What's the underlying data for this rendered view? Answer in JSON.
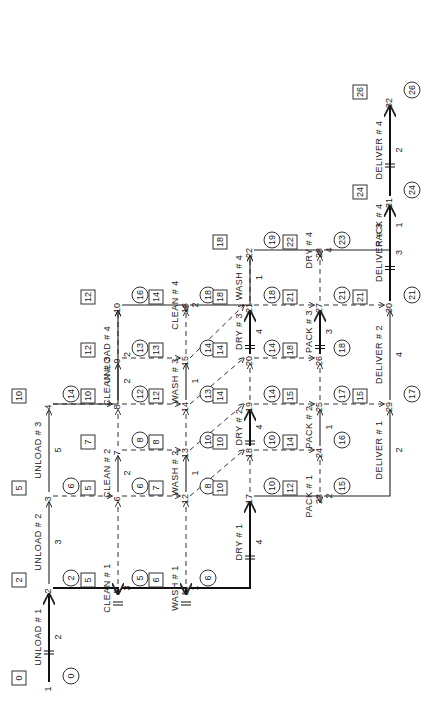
{
  "diagram": {
    "type": "activity-on-arrow network (critical path)",
    "orientation": "rotated 90° counter-clockwise",
    "nodes": [
      {
        "id": 1,
        "early_start": 0,
        "late": 0
      },
      {
        "id": 2,
        "early_start": 2,
        "late": 2
      },
      {
        "id": 3,
        "early_start": 5,
        "late": 6
      },
      {
        "id": 4,
        "early_start": 10,
        "late": 14
      },
      {
        "id": 5,
        "early_start": 5,
        "late": 5
      },
      {
        "id": 6,
        "early_start": 5,
        "late": 6
      },
      {
        "id": 7,
        "early_start": 7,
        "late": 8
      },
      {
        "id": 8,
        "early_start": 10,
        "late": 12
      },
      {
        "id": 9,
        "early_start": 12,
        "late": 13
      },
      {
        "id": 10,
        "early_start": 12,
        "late": 16
      },
      {
        "id": 11,
        "early_start": 6,
        "late": 6
      },
      {
        "id": 12,
        "early_start": 7,
        "late": 8
      },
      {
        "id": 13,
        "early_start": 8,
        "late": 10
      },
      {
        "id": 14,
        "early_start": 12,
        "late": 13
      },
      {
        "id": 15,
        "early_start": 13,
        "late": 14
      },
      {
        "id": 16,
        "early_start": 14,
        "late": 18
      },
      {
        "id": 17,
        "early_start": 10,
        "late": 10
      },
      {
        "id": 18,
        "early_start": 10,
        "late": 10
      },
      {
        "id": 19,
        "early_start": 14,
        "late": 14
      },
      {
        "id": 20,
        "early_start": 14,
        "late": 14
      },
      {
        "id": 21,
        "early_start": 18,
        "late": 18
      },
      {
        "id": 22,
        "early_start": 18,
        "late": 19
      },
      {
        "id": 23,
        "early_start": 12,
        "late": 15
      },
      {
        "id": 24,
        "early_start": 14,
        "late": 16
      },
      {
        "id": 25,
        "early_start": 15,
        "late": 17
      },
      {
        "id": 26,
        "early_start": 18,
        "late": 18
      },
      {
        "id": 27,
        "early_start": 21,
        "late": 21
      },
      {
        "id": 28,
        "early_start": 22,
        "late": 23
      },
      {
        "id": 29,
        "early_start": 15,
        "late": 17
      },
      {
        "id": 30,
        "early_start": 21,
        "late": 21
      },
      {
        "id": 31,
        "early_start": 24,
        "late": 24
      },
      {
        "id": 32,
        "early_start": 26,
        "late": 26
      }
    ],
    "activities": [
      {
        "label": "UNLOAD # 1",
        "from": 1,
        "to": 2,
        "duration": 2,
        "critical": true
      },
      {
        "label": "UNLOAD # 2",
        "from": 2,
        "to": 3,
        "duration": 3,
        "critical": false
      },
      {
        "label": "UNLOAD # 3",
        "from": 3,
        "to": 4,
        "duration": 5,
        "critical": false
      },
      {
        "label": "UNLOAD # 4",
        "from": 4,
        "to": 10,
        "duration": 2,
        "critical": false
      },
      {
        "label": "CLEAN # 1",
        "from": 2,
        "to": 5,
        "duration": 3,
        "critical": true
      },
      {
        "label": "CLEAN # 2",
        "from": 6,
        "to": 7,
        "duration": 2,
        "critical": false
      },
      {
        "label": "CLEAN # 3",
        "from": 8,
        "to": 9,
        "duration": 2,
        "critical": false
      },
      {
        "label": "CLEAN # 4",
        "from": 10,
        "to": 16,
        "duration": 2,
        "critical": false
      },
      {
        "label": "WASH # 1",
        "from": 5,
        "to": 11,
        "duration": 1,
        "critical": true
      },
      {
        "label": "WASH # 2",
        "from": 12,
        "to": 13,
        "duration": 1,
        "critical": false
      },
      {
        "label": "WASH # 3",
        "from": 14,
        "to": 15,
        "duration": 1,
        "critical": false
      },
      {
        "label": "WASH # 4",
        "from": 16,
        "to": 22,
        "duration": 1,
        "critical": false
      },
      {
        "label": "DRY # 1",
        "from": 11,
        "to": 17,
        "duration": 4,
        "critical": true
      },
      {
        "label": "DRY # 2",
        "from": 18,
        "to": 19,
        "duration": 4,
        "critical": true
      },
      {
        "label": "DRY # 3",
        "from": 20,
        "to": 21,
        "duration": 4,
        "critical": true
      },
      {
        "label": "DRY # 4",
        "from": 22,
        "to": 28,
        "duration": 4,
        "critical": false
      },
      {
        "label": "PACK # 1",
        "from": 17,
        "to": 23,
        "duration": 2,
        "critical": false
      },
      {
        "label": "PACK # 2",
        "from": 24,
        "to": 25,
        "duration": 1,
        "critical": false
      },
      {
        "label": "PACK # 3",
        "from": 26,
        "to": 27,
        "duration": 3,
        "critical": true
      },
      {
        "label": "PACK # 4",
        "from": 28,
        "to": 31,
        "duration": 1,
        "critical": false
      },
      {
        "label": "DELIVER # 1",
        "from": 23,
        "to": 29,
        "duration": 2,
        "critical": false
      },
      {
        "label": "DELIVER # 2",
        "from": 29,
        "to": 30,
        "duration": 4,
        "critical": false
      },
      {
        "label": "DELIVER # 3",
        "from": 30,
        "to": 31,
        "duration": 3,
        "critical": true
      },
      {
        "label": "DELIVER # 4",
        "from": 31,
        "to": 32,
        "duration": 2,
        "critical": true
      }
    ]
  }
}
